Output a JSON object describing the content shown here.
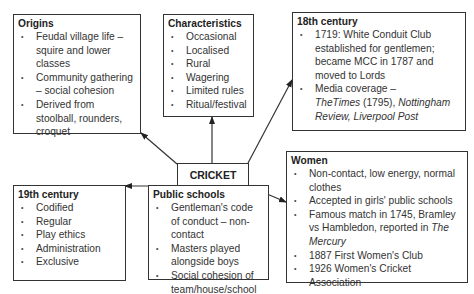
{
  "center": {
    "label": "CRICKET"
  },
  "boxes": {
    "origins": {
      "title": "Origins",
      "items": [
        "Feudal village life – squire and lower classes",
        "Community gathering – social cohesion",
        "Derived from stoolball, rounders, croquet"
      ]
    },
    "characteristics": {
      "title": "Characteristics",
      "items": [
        "Occasional",
        "Localised",
        "Rural",
        "Wagering",
        "Limited rules",
        "Ritual/festival"
      ]
    },
    "c18": {
      "title": "18th century",
      "item1": "1719: White Conduit Club established for gentlemen; became MCC in 1787 and moved to Lords",
      "item2_text": "Media coverage –",
      "item2_italic1": "TheTimes",
      "item2_mid": " (1795), ",
      "item2_italic2": "Nottingham Review, Liverpool Post"
    },
    "women": {
      "title": "Women",
      "item1": "Non-contact, low energy, normal clothes",
      "item2": "Accepted in girls' public schools",
      "item3_text": "Famous match in 1745, Bramley vs Hambledon, reported in ",
      "item3_italic": "The Mercury",
      "item4": "1887 First Women's Club",
      "item5": "1926 Women's Cricket Association"
    },
    "c19": {
      "title": "19th century",
      "items": [
        "Codified",
        "Regular",
        "Play ethics",
        "Administration",
        "Exclusive"
      ]
    },
    "public_schools": {
      "title": "Public schools",
      "items": [
        "Gentleman's code of conduct – non-contact",
        "Masters played alongside boys",
        "Social cohesion of team/house/school"
      ]
    }
  }
}
